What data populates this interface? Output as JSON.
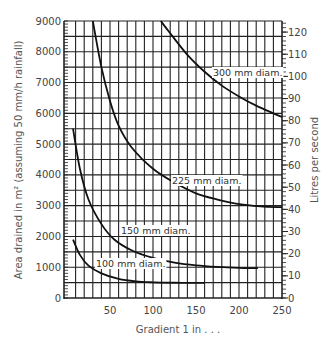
{
  "chart_data": {
    "type": "line",
    "title": "",
    "xlabel": "Gradient 1 in . . .",
    "ylabel": "Area drained in m² (assuming 50 mm/h rainfall)",
    "ylabel_right": "Litres per second",
    "xlim": [
      0,
      250
    ],
    "ylim": [
      0,
      9000
    ],
    "ylim_right": [
      0,
      125
    ],
    "grid": true,
    "x_ticks": [
      50,
      100,
      150,
      200,
      250
    ],
    "y_ticks": [
      0,
      1000,
      2000,
      3000,
      4000,
      5000,
      6000,
      7000,
      8000,
      9000
    ],
    "y_right_ticks": [
      0,
      10,
      20,
      30,
      40,
      50,
      60,
      70,
      80,
      90,
      100,
      110,
      120
    ],
    "series": [
      {
        "name": "300 mm diam.",
        "x": [
          109,
          120,
          140,
          160,
          180,
          200,
          220,
          240,
          250
        ],
        "y": [
          9000,
          8600,
          7900,
          7350,
          6900,
          6550,
          6250,
          6000,
          5880
        ]
      },
      {
        "name": "225 mm diam.",
        "x": [
          30,
          40,
          50,
          60,
          75,
          100,
          125,
          150,
          175,
          200,
          225,
          250
        ],
        "y": [
          9000,
          7500,
          6400,
          5600,
          4900,
          4200,
          3750,
          3400,
          3200,
          3050,
          2980,
          2950
        ]
      },
      {
        "name": "150 mm diam.",
        "x": [
          7,
          15,
          25,
          40,
          55,
          75,
          100,
          125,
          150,
          175,
          200,
          222
        ],
        "y": [
          5500,
          4200,
          3200,
          2400,
          1900,
          1550,
          1300,
          1150,
          1060,
          1010,
          980,
          970
        ]
      },
      {
        "name": "100 mm diam.",
        "x": [
          7,
          15,
          25,
          40,
          60,
          80,
          100,
          125,
          150,
          160
        ],
        "y": [
          1900,
          1400,
          1050,
          800,
          620,
          540,
          510,
          495,
          490,
          490
        ]
      }
    ]
  },
  "labels": {
    "xlabel": "Gradient 1 in . . .",
    "ylabel": "Area drained in m² (assuming 50 mm/h rainfall)",
    "ylabel_right": "Litres per second"
  }
}
